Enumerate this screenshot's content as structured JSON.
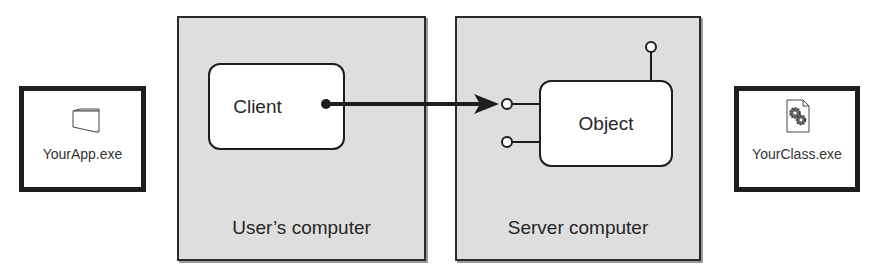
{
  "left_file": {
    "label": "YourApp.exe",
    "icon": "folder-icon"
  },
  "right_file": {
    "label": "YourClass.exe",
    "icon": "gears-document-icon"
  },
  "client_panel": {
    "label": "User’s computer"
  },
  "server_panel": {
    "label": "Server computer"
  },
  "client_node": {
    "label": "Client"
  },
  "object_node": {
    "label": "Object"
  },
  "connection": {
    "from": "Client",
    "to": "Object interface",
    "style": "arrow"
  },
  "interfaces": [
    {
      "position": "left-top",
      "connected": true
    },
    {
      "position": "left-bottom",
      "connected": false
    },
    {
      "position": "top",
      "connected": false
    }
  ],
  "colors": {
    "panel_fill": "#dedede",
    "stroke": "#1e1e1e",
    "node_fill": "#ffffff"
  }
}
